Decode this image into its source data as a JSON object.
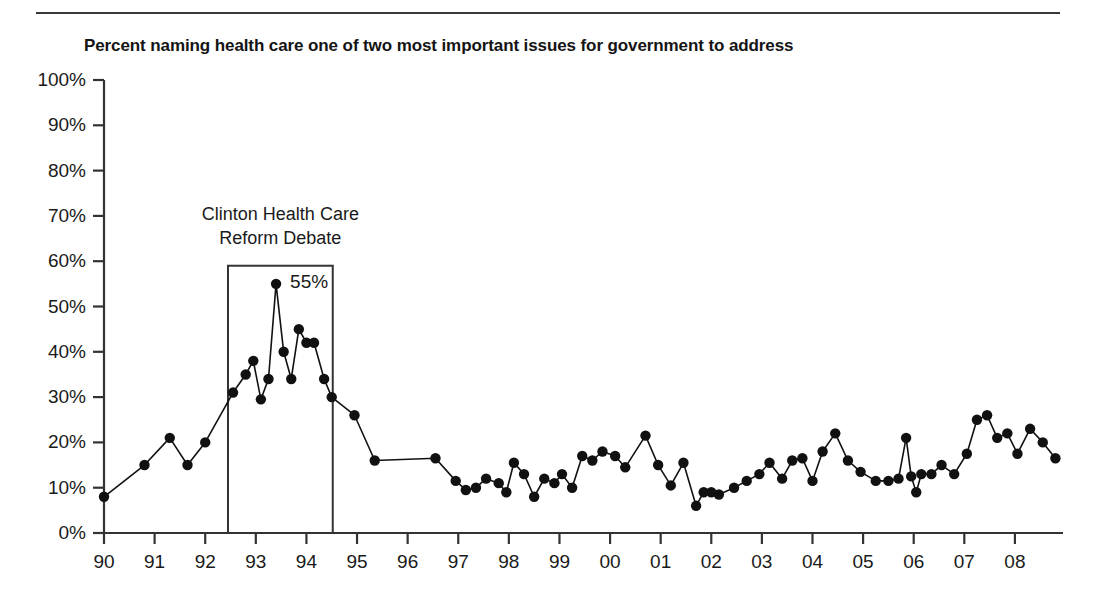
{
  "chart_data": {
    "type": "line",
    "title": "Percent naming health care one of two most important issues for government to address",
    "xlabel": "",
    "ylabel": "",
    "ylim": [
      0,
      100
    ],
    "xlim": [
      1990.0,
      2008.95
    ],
    "grid": false,
    "legend": null,
    "y_ticks": [
      "0%",
      "10%",
      "20%",
      "30%",
      "40%",
      "50%",
      "60%",
      "70%",
      "80%",
      "90%",
      "100%"
    ],
    "y_tick_values": [
      0,
      10,
      20,
      30,
      40,
      50,
      60,
      70,
      80,
      90,
      100
    ],
    "x_ticks": [
      "90",
      "91",
      "92",
      "93",
      "94",
      "95",
      "96",
      "97",
      "98",
      "99",
      "00",
      "01",
      "02",
      "03",
      "04",
      "05",
      "06",
      "07",
      "08"
    ],
    "x_tick_values": [
      1990,
      1991,
      1992,
      1993,
      1994,
      1995,
      1996,
      1997,
      1998,
      1999,
      2000,
      2001,
      2002,
      2003,
      2004,
      2005,
      2006,
      2007,
      2008
    ],
    "marker": "filled-circle",
    "line_color": "#111111",
    "marker_color": "#111111",
    "series": [
      {
        "name": "Health care named top-two issue",
        "x": [
          1990.0,
          1990.8,
          1991.3,
          1991.65,
          1992.0,
          1992.55,
          1992.8,
          1992.95,
          1993.1,
          1993.25,
          1993.4,
          1993.55,
          1993.7,
          1993.85,
          1994.0,
          1994.15,
          1994.35,
          1994.5,
          1994.95,
          1995.35,
          1996.55,
          1996.95,
          1997.15,
          1997.35,
          1997.55,
          1997.8,
          1997.95,
          1998.1,
          1998.3,
          1998.5,
          1998.7,
          1998.9,
          1999.05,
          1999.25,
          1999.45,
          1999.65,
          1999.85,
          2000.1,
          2000.3,
          2000.7,
          2000.95,
          2001.2,
          2001.45,
          2001.7,
          2001.85,
          2002.0,
          2002.15,
          2002.45,
          2002.7,
          2002.95,
          2003.15,
          2003.4,
          2003.6,
          2003.8,
          2004.0,
          2004.2,
          2004.45,
          2004.7,
          2004.95,
          2005.25,
          2005.5,
          2005.7,
          2005.85,
          2005.95,
          2006.05,
          2006.15,
          2006.35,
          2006.55,
          2006.8,
          2007.05,
          2007.25,
          2007.45,
          2007.65,
          2007.85,
          2008.05,
          2008.3,
          2008.55,
          2008.8
        ],
        "y": [
          8,
          15,
          21,
          15,
          20,
          31,
          35,
          38,
          29.5,
          34,
          55,
          40,
          34,
          45,
          42,
          42,
          34,
          30,
          26,
          16,
          16.5,
          11.5,
          9.5,
          10,
          12,
          11,
          9,
          15.5,
          13,
          8,
          12,
          11,
          13,
          10,
          17,
          16,
          18,
          17,
          14.5,
          21.5,
          15,
          10.5,
          15.5,
          6,
          9,
          9,
          8.5,
          10,
          11.5,
          13,
          15.5,
          12,
          16,
          16.5,
          11.5,
          18,
          22,
          16,
          13.5,
          11.5,
          11.5,
          12,
          21,
          12.5,
          9,
          13,
          13,
          15,
          13,
          17.5,
          25,
          26,
          21,
          22,
          17.5,
          23,
          20,
          16.5
        ]
      }
    ],
    "annotations": [
      {
        "name": "clinton-debate",
        "text_line1": "Clinton Health Care",
        "text_line2": "Reform Debate",
        "box_x_start": 1992.45,
        "box_x_end": 1994.52,
        "box_y_start": 0,
        "box_y_end": 59
      },
      {
        "name": "peak-value",
        "text": "55%",
        "x": 1993.4,
        "y": 55
      }
    ]
  }
}
